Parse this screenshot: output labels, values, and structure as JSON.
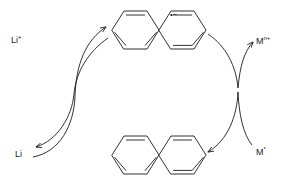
{
  "diagram": {
    "type": "catalytic-cycle",
    "stroke_color": "#1a1a1a",
    "background_color": "#ffffff",
    "labels": {
      "lithium_cation": "Li",
      "lithium_cation_charge": "+",
      "lithium_metal": "Li",
      "metal_cation": "M",
      "metal_cation_charge": "n+",
      "metal_zero": "M",
      "metal_zero_charge": "*",
      "radical_anion_mark": "•−"
    },
    "species": [
      {
        "name": "lithium-cation",
        "text": "Li+",
        "position": "top-left"
      },
      {
        "name": "lithium-metal",
        "text": "Li",
        "position": "bottom-left"
      },
      {
        "name": "naphthalene-radical-anion",
        "text": "naphthalene •−",
        "position": "top-center"
      },
      {
        "name": "naphthalene-neutral",
        "text": "naphthalene",
        "position": "bottom-center"
      },
      {
        "name": "metal-cation",
        "text": "Mn+",
        "position": "top-right"
      },
      {
        "name": "metal-zero",
        "text": "M*",
        "position": "bottom-right"
      }
    ],
    "arrows": [
      {
        "name": "li-metal-to-radical-anion",
        "from": "Li",
        "to": "naphthalene-radical-anion"
      },
      {
        "name": "radical-anion-to-li-cation",
        "from": "naphthalene-radical-anion",
        "to": "Li+"
      },
      {
        "name": "radical-anion-to-metal-cation-reduction",
        "from": "naphthalene-radical-anion",
        "to": "Mn+"
      },
      {
        "name": "metal-zero-to-naphthalene",
        "from": "M*",
        "to": "naphthalene"
      }
    ]
  }
}
